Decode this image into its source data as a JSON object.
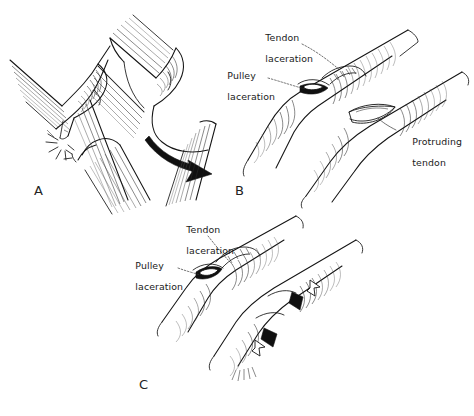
{
  "figure": {
    "background_color": "#ffffff",
    "ink_color": "#141414",
    "width": 474,
    "height": 416
  },
  "panels": [
    {
      "id": "A",
      "letter": "A",
      "letter_x": 34,
      "letter_y": 183,
      "description": "Two flexed digit / tendon-pulley schematics; left shows the pulley rupturing with burst lines, right shows the tendon bowstringing away from bone with a curved arrow",
      "labels": [],
      "markers": [
        {
          "name": "rupture-burst",
          "type": "burst-lines",
          "x": 62,
          "y": 139
        },
        {
          "name": "bowstring-arrow",
          "type": "curved-arrow",
          "x": 178,
          "y": 148
        }
      ]
    },
    {
      "id": "B",
      "letter": "B",
      "letter_x": 235,
      "letter_y": 183,
      "description": "Finger with a tendon laceration and pulley laceration at the proximal site, and tendon protruding through the sheath distally",
      "labels": [
        {
          "name": "tendon-laceration-label",
          "lines": [
            "Tendon",
            "laceration"
          ],
          "x": 253,
          "y": 22,
          "align": "left",
          "leader": "dashed"
        },
        {
          "name": "pulley-laceration-label",
          "lines": [
            "Pulley",
            "laceration"
          ],
          "x": 215,
          "y": 60,
          "align": "left",
          "leader": "dashed"
        },
        {
          "name": "protruding-tendon-label",
          "lines": [
            "Protruding",
            "tendon"
          ],
          "x": 400,
          "y": 126,
          "align": "left",
          "leader": "solid"
        }
      ],
      "markers": []
    },
    {
      "id": "C",
      "letter": "C",
      "letter_x": 139,
      "letter_y": 377,
      "description": "Repeat view showing tendon and pulley laceration with repair sites indicated by paired solid black and open white arrowheads",
      "labels": [
        {
          "name": "tendon-laceration-label",
          "lines": [
            "Tendon",
            "laceration"
          ],
          "x": 174,
          "y": 214,
          "align": "left",
          "leader": "dashed"
        },
        {
          "name": "pulley-laceration-label",
          "lines": [
            "Pulley",
            "laceration"
          ],
          "x": 123,
          "y": 250,
          "align": "left",
          "leader": "dashed"
        }
      ],
      "markers": [
        {
          "name": "repair-arrowhead-open-upper",
          "type": "open-arrowhead",
          "x": 311,
          "y": 288
        },
        {
          "name": "repair-arrowhead-solid-upper",
          "type": "solid-arrowhead",
          "x": 297,
          "y": 301
        },
        {
          "name": "repair-arrowhead-solid-lower",
          "type": "solid-arrowhead",
          "x": 270,
          "y": 337
        },
        {
          "name": "repair-arrowhead-open-lower",
          "type": "open-arrowhead",
          "x": 256,
          "y": 348
        }
      ]
    }
  ]
}
